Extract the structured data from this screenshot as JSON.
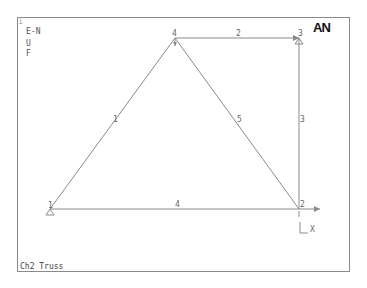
{
  "window": {
    "number": "1",
    "logo": "AN"
  },
  "legend": {
    "lines": [
      "E-N",
      "U",
      "F"
    ]
  },
  "title": "Ch2 Truss",
  "nodes": [
    {
      "id": "1",
      "x": 50,
      "y": 209
    },
    {
      "id": "2",
      "x": 299,
      "y": 209
    },
    {
      "id": "3",
      "x": 299,
      "y": 38
    },
    {
      "id": "4",
      "x": 175,
      "y": 38
    }
  ],
  "elements": [
    {
      "id": "1",
      "from": "1",
      "to": "4"
    },
    {
      "id": "2",
      "from": "4",
      "to": "3"
    },
    {
      "id": "3",
      "from": "3",
      "to": "2"
    },
    {
      "id": "4",
      "from": "1",
      "to": "2"
    },
    {
      "id": "5",
      "from": "4",
      "to": "2"
    }
  ],
  "loads": [
    {
      "node": "4",
      "direction": "down"
    },
    {
      "node": "3",
      "direction": "right"
    },
    {
      "node": "2",
      "direction": "down"
    }
  ],
  "supports": [
    {
      "node": "1",
      "type": "pin"
    },
    {
      "node": "3",
      "type": "pin"
    }
  ],
  "axis": {
    "x_label": "X",
    "y_label": "Y"
  }
}
